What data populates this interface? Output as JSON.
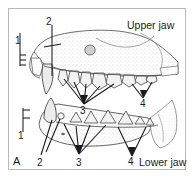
{
  "figure": {
    "plate_letter": "A",
    "caption_upper": "Upper jaw",
    "caption_lower": "Lower jaw",
    "colors": {
      "ink": "#1b1b1b",
      "border": "#b9b9b9",
      "paper": "#ffffff",
      "stipple": "#9a9a9a",
      "bone_shade": "#d8d8d8",
      "bone_light": "#efefef"
    }
  },
  "labels": {
    "upper_bracket_1": "1",
    "upper_line_2": "2",
    "upper_fan_3": "3",
    "upper_fan_4": "4",
    "lower_bracket_1": "1",
    "lower_fan_2": "2",
    "lower_fan_3": "3",
    "lower_fan_4": "4"
  },
  "legend_items": [
    {
      "key": "1",
      "name": "incisors"
    },
    {
      "key": "2",
      "name": "canine"
    },
    {
      "key": "3",
      "name": "premolars"
    },
    {
      "key": "4",
      "name": "molars"
    }
  ],
  "panels": [
    {
      "id": "upper-jaw-panel",
      "caption": "Upper jaw"
    },
    {
      "id": "lower-jaw-panel",
      "caption": "Lower jaw"
    }
  ]
}
